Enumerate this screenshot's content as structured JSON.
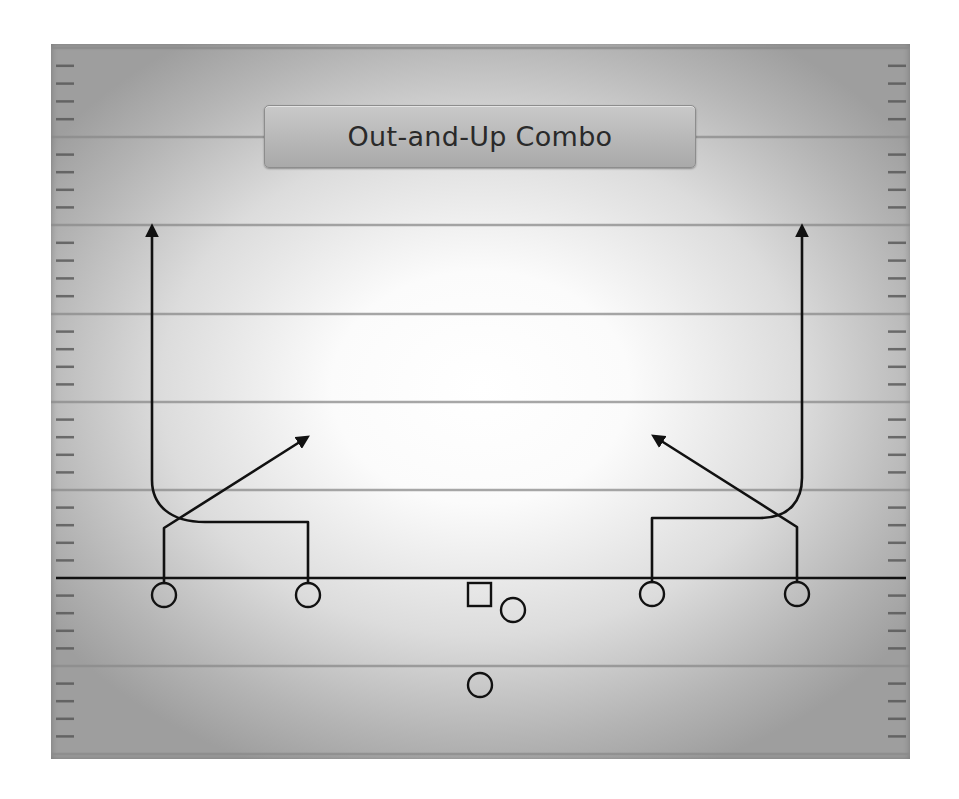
{
  "title": "Out-and-Up Combo",
  "colors": {
    "line": "#111111",
    "yard_line": "#8a8a8a",
    "hash": "#555555",
    "field_center": "#ffffff",
    "field_edge": "#9e9e9e"
  },
  "field": {
    "yard_lines_y": [
      137,
      225,
      314,
      402,
      490,
      666
    ],
    "line_of_scrimmage_y": 578
  },
  "players": [
    {
      "role": "receiver",
      "position": "left-outside",
      "shape": "circle",
      "x": 164,
      "y": 595
    },
    {
      "role": "receiver",
      "position": "left-slot",
      "shape": "circle",
      "x": 308,
      "y": 595
    },
    {
      "role": "center",
      "position": "center",
      "shape": "square",
      "x": 479,
      "y": 594
    },
    {
      "role": "quarterback",
      "position": "qb",
      "shape": "circle",
      "x": 513,
      "y": 610
    },
    {
      "role": "receiver",
      "position": "right-slot",
      "shape": "circle",
      "x": 652,
      "y": 594
    },
    {
      "role": "receiver",
      "position": "right-outside",
      "shape": "circle",
      "x": 797,
      "y": 594
    },
    {
      "role": "running-back",
      "position": "tailback",
      "shape": "circle",
      "x": 480,
      "y": 685
    }
  ],
  "routes": [
    {
      "name": "left-outside-post",
      "from": "left-outside",
      "type": "angled"
    },
    {
      "name": "left-slot-out-and-up",
      "from": "left-slot",
      "type": "out-and-up"
    },
    {
      "name": "right-slot-out-and-up",
      "from": "right-slot",
      "type": "out-and-up"
    },
    {
      "name": "right-outside-post",
      "from": "right-outside",
      "type": "angled"
    }
  ]
}
